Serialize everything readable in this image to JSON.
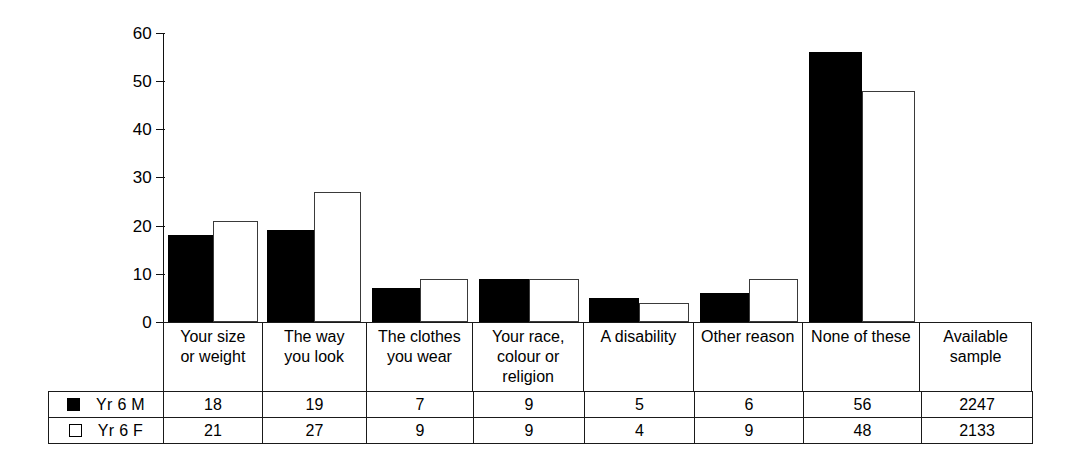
{
  "chart_data": {
    "type": "bar",
    "title": "",
    "subtitle": "",
    "xlabel": "",
    "ylabel": "",
    "ylim": [
      0,
      60
    ],
    "yticks": [
      0,
      10,
      20,
      30,
      40,
      50,
      60
    ],
    "ytick_labels": [
      "0",
      "10",
      "20",
      "30",
      "40",
      "50",
      "60"
    ],
    "grid": false,
    "legend_position": "table-left",
    "categories": [
      "Your size or weight",
      "The way you look",
      "The clothes you wear",
      "Your race, colour or religion",
      "A disability",
      "Other reason",
      "None of these"
    ],
    "series": [
      {
        "name": "Yr 6 M",
        "color": "#000000",
        "style": "filled",
        "values": [
          18,
          19,
          7,
          9,
          5,
          6,
          56
        ]
      },
      {
        "name": "Yr 6 F",
        "color": "#ffffff",
        "style": "hollow",
        "values": [
          21,
          27,
          9,
          9,
          4,
          9,
          48
        ]
      }
    ],
    "extra_column": {
      "label": "Available sample",
      "values": [
        2247,
        2133
      ]
    }
  },
  "axis": {
    "ticks": [
      {
        "label": "60",
        "value": 60
      },
      {
        "label": "50",
        "value": 50
      },
      {
        "label": "40",
        "value": 40
      },
      {
        "label": "30",
        "value": 30
      },
      {
        "label": "20",
        "value": 20
      },
      {
        "label": "10",
        "value": 10
      },
      {
        "label": "0",
        "value": 0
      }
    ]
  },
  "category_header": {
    "cells": [
      {
        "lines": [
          "Your size",
          "or weight"
        ]
      },
      {
        "lines": [
          "The way",
          "you look"
        ]
      },
      {
        "lines": [
          "The clothes",
          "you wear"
        ]
      },
      {
        "lines": [
          "Your race,",
          "colour or",
          "religion"
        ]
      },
      {
        "lines": [
          "A disability"
        ]
      },
      {
        "lines": [
          "Other reason"
        ]
      },
      {
        "lines": [
          "None of these"
        ]
      },
      {
        "lines": [
          "Available",
          "sample"
        ]
      }
    ]
  },
  "table": {
    "rows": [
      {
        "legend_label": "Yr 6 M",
        "swatch": "filled-square-icon",
        "cells": [
          "18",
          "19",
          "7",
          "9",
          "5",
          "6",
          "56",
          "2247"
        ]
      },
      {
        "legend_label": "Yr 6 F",
        "swatch": "hollow-square-icon",
        "cells": [
          "21",
          "27",
          "9",
          "9",
          "4",
          "9",
          "48",
          "2133"
        ]
      }
    ]
  }
}
